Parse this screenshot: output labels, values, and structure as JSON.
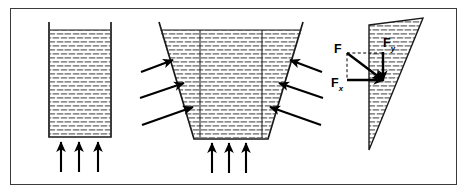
{
  "figure": {
    "background_color": "#ffffff",
    "frame": {
      "name": "figure-border",
      "x": 10,
      "y": 8,
      "width": 447,
      "height": 177,
      "stroke_color": "#3a3a3c",
      "stroke_width": 1.6
    },
    "ink_color": "#000000",
    "fluid_fill_color": "#9a9a9a",
    "fluid_pattern": "horizontal-dash-brick"
  },
  "panels": [
    {
      "id": "panel-vertical-container",
      "name": "vertical-walled-container",
      "description": "Rectangular container with vertical walls filled with fluid, three upward force arrows beneath the base",
      "container": {
        "left": 48,
        "top": 22,
        "right": 112,
        "bottom": 137
      },
      "wall_stub_height": 8,
      "bottom_arrows": {
        "count": 3,
        "direction": "up",
        "x_positions": [
          61,
          79,
          98
        ],
        "tail_y": 171,
        "head_y": 141
      }
    },
    {
      "id": "panel-trapezoid-container",
      "name": "outward-sloping-container",
      "description": "Trapezoidal container with outward sloping walls, three pressure arrows on each slanted wall and three upward arrows beneath the base",
      "container": {
        "top_left": [
          159,
          22
        ],
        "top_right": [
          303,
          22
        ],
        "bottom_right": [
          268,
          139
        ],
        "bottom_left": [
          194,
          139
        ]
      },
      "interior_vertical_lines_x": [
        200,
        262
      ],
      "left_wall_arrows": {
        "count": 3,
        "direction": "up-right",
        "label": "pressure normal to left wall"
      },
      "right_wall_arrows": {
        "count": 3,
        "direction": "up-left",
        "label": "pressure normal to right wall"
      },
      "bottom_arrows": {
        "count": 3,
        "direction": "up",
        "x_positions": [
          212,
          228,
          245
        ],
        "tail_y": 172,
        "head_y": 142
      }
    },
    {
      "id": "panel-force-decomposition",
      "name": "wedge-force-decomposition",
      "description": "Triangular fluid wedge with vertical left edge and sloping hypotenuse; resultant force F resolved into horizontal Fx and vertical Fy components",
      "wedge": {
        "apex": [
          369,
          150
        ],
        "top_left": [
          369,
          25
        ],
        "top_right": [
          424,
          18
        ]
      },
      "vectors": [
        {
          "name": "resultant-force",
          "label": "F",
          "subscript": "",
          "from": [
            347,
            53
          ],
          "to": [
            383,
            80
          ],
          "direction": "down-right"
        },
        {
          "name": "horizontal-component",
          "label": "F",
          "subscript": "x",
          "from": [
            347,
            80
          ],
          "to": [
            383,
            80
          ],
          "direction": "right"
        },
        {
          "name": "vertical-component",
          "label": "F",
          "subscript": "y",
          "from": [
            383,
            53
          ],
          "to": [
            383,
            80
          ],
          "direction": "down"
        }
      ]
    }
  ],
  "labels": {
    "force_resultant": {
      "text": "F",
      "subscript": ""
    },
    "force_x": {
      "text": "F",
      "subscript": "x"
    },
    "force_y": {
      "text": "F",
      "subscript": "y"
    }
  }
}
